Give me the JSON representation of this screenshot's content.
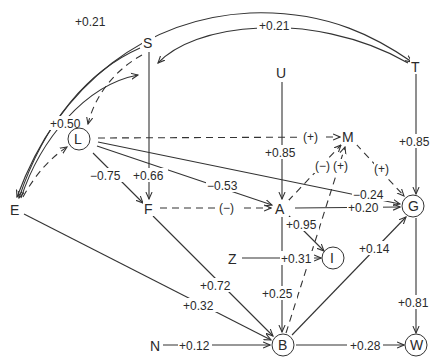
{
  "diagram": {
    "type": "path-diagram",
    "nodes": {
      "S": {
        "label": "S",
        "circled": false
      },
      "U": {
        "label": "U",
        "circled": false
      },
      "T": {
        "label": "T",
        "circled": false
      },
      "L": {
        "label": "L",
        "circled": true
      },
      "M": {
        "label": "M",
        "circled": false
      },
      "E": {
        "label": "E",
        "circled": false
      },
      "F": {
        "label": "F",
        "circled": false
      },
      "A": {
        "label": "A",
        "circled": false
      },
      "G": {
        "label": "G",
        "circled": true
      },
      "Z": {
        "label": "Z",
        "circled": false
      },
      "I": {
        "label": "I",
        "circled": true
      },
      "N": {
        "label": "N",
        "circled": false
      },
      "B": {
        "label": "B",
        "circled": true
      },
      "W": {
        "label": "W",
        "circled": true
      }
    },
    "edges": [
      {
        "from": "E",
        "to": "T",
        "label": "+0.21",
        "style": "solid",
        "bidirectional": true
      },
      {
        "from": "T",
        "to": "S",
        "label": "+0.21",
        "style": "solid",
        "bidirectional": true
      },
      {
        "from": "S",
        "to": "E",
        "label": "+0.50",
        "style": "solid",
        "bidirectional": true
      },
      {
        "from": "S",
        "to": "L",
        "label": "",
        "style": "dashed",
        "bidirectional": true
      },
      {
        "from": "E",
        "to": "L",
        "label": "",
        "style": "dashed",
        "bidirectional": true
      },
      {
        "from": "L",
        "to": "M",
        "label": "(+)",
        "style": "dashed"
      },
      {
        "from": "L",
        "to": "F",
        "label": "-0.75",
        "style": "solid"
      },
      {
        "from": "S",
        "to": "F",
        "label": "+0.66",
        "style": "solid"
      },
      {
        "from": "L",
        "to": "A",
        "label": "-0.53",
        "style": "solid"
      },
      {
        "from": "L",
        "to": "G",
        "label": "-0.24",
        "style": "solid"
      },
      {
        "from": "U",
        "to": "A",
        "label": "+0.85",
        "style": "solid"
      },
      {
        "from": "T",
        "to": "G",
        "label": "+0.85",
        "style": "solid"
      },
      {
        "from": "F",
        "to": "A",
        "label": "(-)",
        "style": "dashed"
      },
      {
        "from": "A",
        "to": "M",
        "label": "(-)",
        "style": "dashed"
      },
      {
        "from": "B",
        "to": "M",
        "label": "(+)",
        "style": "dashed"
      },
      {
        "from": "M",
        "to": "G",
        "label": "(+)",
        "style": "dashed"
      },
      {
        "from": "A",
        "to": "G",
        "label": "+0.20",
        "style": "solid"
      },
      {
        "from": "A",
        "to": "I",
        "label": "+0.95",
        "style": "solid"
      },
      {
        "from": "Z",
        "to": "I",
        "label": "+0.31",
        "style": "solid"
      },
      {
        "from": "A",
        "to": "B",
        "label": "+0.25",
        "style": "solid"
      },
      {
        "from": "F",
        "to": "B",
        "label": "+0.72",
        "style": "solid"
      },
      {
        "from": "E",
        "to": "B",
        "label": "+0.32",
        "style": "solid"
      },
      {
        "from": "N",
        "to": "B",
        "label": "+0.12",
        "style": "solid"
      },
      {
        "from": "B",
        "to": "G",
        "label": "+0.14",
        "style": "solid"
      },
      {
        "from": "B",
        "to": "W",
        "label": "+0.28",
        "style": "solid"
      },
      {
        "from": "G",
        "to": "W",
        "label": "+0.81",
        "style": "solid"
      }
    ]
  },
  "labels": {
    "e_et": "+0.21",
    "e_ts": "+0.21",
    "e_se": "+0.50",
    "e_lm": "(+)",
    "e_lf": "−0.75",
    "e_sf": "+0.66",
    "e_la": "−0.53",
    "e_lg": "−0.24",
    "e_ua": "+0.85",
    "e_tg": "+0.85",
    "e_fa": "(−)",
    "e_am": "(−)",
    "e_bm": "(+)",
    "e_mg": "(+)",
    "e_ag": "+0.20",
    "e_ai": "+0.95",
    "e_zi": "+0.31",
    "e_ab": "+0.25",
    "e_fb": "+0.72",
    "e_eb": "+0.32",
    "e_nb": "+0.12",
    "e_bg": "+0.14",
    "e_bw": "+0.28",
    "e_gw": "+0.81"
  }
}
